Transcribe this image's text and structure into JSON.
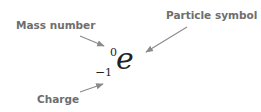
{
  "labels": {
    "mass_number": "Mass number",
    "particle_symbol": "Particle symbol",
    "charge": "Charge"
  },
  "notation": {
    "symbol": "e",
    "mass_number": "0",
    "charge_sign": "−",
    "charge_value": "1"
  },
  "colors": {
    "label_text": "#6e6e6e",
    "arrow": "#8a8a8a",
    "notation": "#222222"
  }
}
